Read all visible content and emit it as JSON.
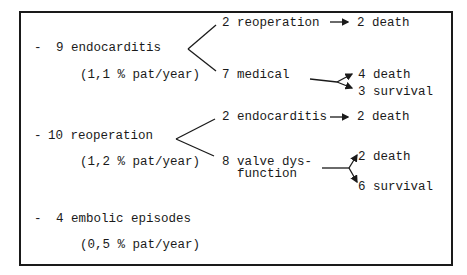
{
  "diagram": {
    "type": "outcome-tree",
    "events": [
      {
        "bullet": "-",
        "label": "9 endocarditis",
        "rate": "(1,1 % pat/year)",
        "branches": [
          {
            "label": "2 reoperation",
            "arrow": "→",
            "outcomes": [
              "2 death"
            ]
          },
          {
            "label": "7 medical",
            "outcomes": [
              "4 death",
              "3 survival"
            ]
          }
        ]
      },
      {
        "bullet": "-",
        "label": "10 reoperation",
        "rate": "(1,2 % pat/year)",
        "branches": [
          {
            "label": "2 endocarditis",
            "arrow": "→",
            "outcomes": [
              "2 death"
            ]
          },
          {
            "label_line1": "8 valve dys-",
            "label_line2": "function",
            "outcomes": [
              "2 death",
              "6 survival"
            ]
          }
        ]
      },
      {
        "bullet": "-",
        "label": "4 embolic episodes",
        "rate": "(0,5 % pat/year)"
      }
    ]
  }
}
